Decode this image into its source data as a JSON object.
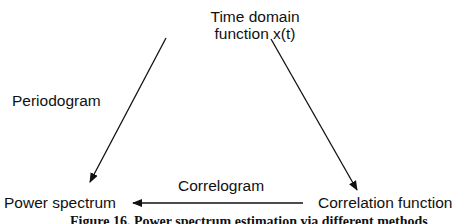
{
  "nodes": {
    "time_domain": {
      "line1": "Time domain",
      "line2": "function x(t)"
    },
    "power_spectrum": "Power spectrum",
    "correlation_function": "Correlation function"
  },
  "edges": {
    "periodogram": {
      "label": "Periodogram",
      "from": "time_domain",
      "to": "power_spectrum"
    },
    "time_to_correlation": {
      "label": "",
      "from": "time_domain",
      "to": "correlation_function"
    },
    "correlogram": {
      "label": "Correlogram",
      "from": "correlation_function",
      "to": "power_spectrum"
    }
  },
  "caption": "Figure 16. Power spectrum estimation via different methods",
  "colors": {
    "ink": "#111111",
    "background": "#ffffff"
  }
}
